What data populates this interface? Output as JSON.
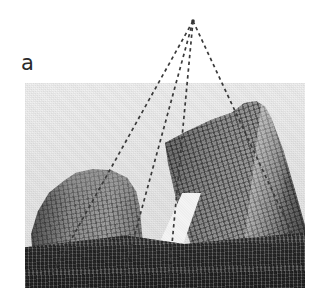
{
  "figure": {
    "panel_label": "a",
    "caption": "",
    "type": "photograph-with-perspective-overlay"
  },
  "photo": {
    "subject": "two high-rise towers photographed looking upward from street level",
    "scene_description": "Black-and-white upward-looking photograph of two skyscrapers converging toward a single vanishing point, with dashed construction lines drawn along the building edges.",
    "bounds": {
      "left": 25,
      "top": 83,
      "width": 280,
      "height": 205
    },
    "background": "#ececec"
  },
  "overlay": {
    "vanishing_point": {
      "x": 193,
      "y": 21
    },
    "vanishing_point_label": "",
    "line_color": "#3a3a3a",
    "dash_pattern": "3.4 3.4",
    "lines": [
      {
        "name": "left-tower-left-edge",
        "x1": 193,
        "y1": 21,
        "x2": 53,
        "y2": 272
      },
      {
        "name": "left-tower-right-edge",
        "x1": 193,
        "y1": 21,
        "x2": 124,
        "y2": 274
      },
      {
        "name": "right-tower-left-edge",
        "x1": 193,
        "y1": 21,
        "x2": 169,
        "y2": 276
      },
      {
        "name": "right-tower-right-edge",
        "x1": 193,
        "y1": 21,
        "x2": 292,
        "y2": 233
      }
    ]
  },
  "colors": {
    "page_background": "#ffffff",
    "sky": "#ececec",
    "tower_midtone": "#888888",
    "podium_dark": "#323232",
    "label_text": "#2b2b2b",
    "overlay_line": "#3a3a3a"
  }
}
